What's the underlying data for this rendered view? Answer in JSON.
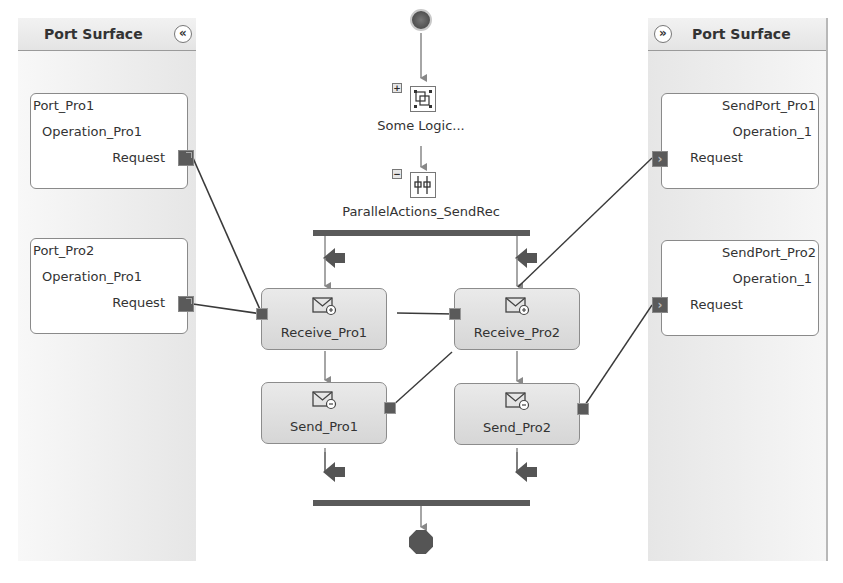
{
  "left_panel": {
    "title": "Port Surface",
    "collapse_glyph": "«",
    "ports": [
      {
        "name": "Port_Pro1",
        "operation": "Operation_Pro1",
        "message": "Request"
      },
      {
        "name": "Port_Pro2",
        "operation": "Operation_Pro1",
        "message": "Request"
      }
    ]
  },
  "right_panel": {
    "title": "Port Surface",
    "collapse_glyph": "»",
    "ports": [
      {
        "name": "SendPort_Pro1",
        "operation": "Operation_1",
        "message": "Request"
      },
      {
        "name": "SendPort_Pro2",
        "operation": "Operation_1",
        "message": "Request"
      }
    ]
  },
  "orchestration": {
    "start": "start-node",
    "scope": {
      "label": "Some Logic...",
      "expander": "+"
    },
    "parallel": {
      "label": "ParallelActions_SendRec",
      "expander": "−"
    },
    "shapes": [
      {
        "id": "receive1",
        "label": "Receive_Pro1",
        "type": "receive"
      },
      {
        "id": "receive2",
        "label": "Receive_Pro2",
        "type": "receive"
      },
      {
        "id": "send1",
        "label": "Send_Pro1",
        "type": "send"
      },
      {
        "id": "send2",
        "label": "Send_Pro2",
        "type": "send"
      }
    ],
    "end": "end-node"
  },
  "colors": {
    "wire": "#3a3a3a",
    "flow_arrow": "#888888",
    "bar": "#5a5a5a",
    "shape_fill": "#dedede",
    "panel_bg": "#ececec"
  }
}
